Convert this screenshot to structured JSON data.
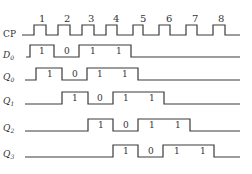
{
  "diagram": {
    "clock": {
      "label": "CP",
      "pulse_numbers": [
        "1",
        "2",
        "3",
        "4",
        "5",
        "6",
        "7",
        "8"
      ]
    },
    "signals": [
      {
        "name": "D0",
        "label": "D",
        "sub": "0",
        "bits": [
          "1",
          "0",
          "1",
          "1"
        ]
      },
      {
        "name": "Q0",
        "label": "Q",
        "sub": "0",
        "bits": [
          "1",
          "0",
          "1",
          "1"
        ]
      },
      {
        "name": "Q1",
        "label": "Q",
        "sub": "1",
        "bits": [
          "1",
          "0",
          "1",
          "1"
        ]
      },
      {
        "name": "Q2",
        "label": "Q",
        "sub": "2",
        "bits": [
          "1",
          "0",
          "1",
          "1"
        ]
      },
      {
        "name": "Q3",
        "label": "Q",
        "sub": "3",
        "bits": [
          "1",
          "0",
          "1",
          "1"
        ]
      }
    ],
    "colors": {
      "line": "#3a3a3a",
      "text": "#333333",
      "background": "#ffffff"
    }
  }
}
